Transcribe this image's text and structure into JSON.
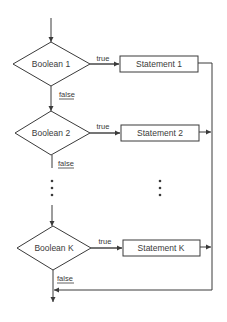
{
  "diagram": {
    "type": "flowchart",
    "decisions": [
      {
        "label": "Boolean 1",
        "true_label": "true",
        "false_label": "false"
      },
      {
        "label": "Boolean 2",
        "true_label": "true",
        "false_label": "false"
      },
      {
        "label": "Boolean K",
        "true_label": "true",
        "false_label": "false"
      }
    ],
    "statements": [
      {
        "label": "Statement 1"
      },
      {
        "label": "Statement 2"
      },
      {
        "label": "Statement K"
      }
    ],
    "ellipsis": "⋮",
    "colors": {
      "line": "#3a3a3a",
      "background": "#ffffff"
    }
  }
}
